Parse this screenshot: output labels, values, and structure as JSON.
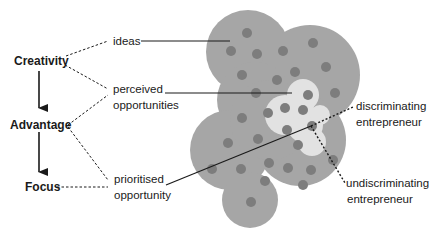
{
  "diagram": {
    "stages": [
      {
        "label": "Creativity"
      },
      {
        "label": "Advantage"
      },
      {
        "label": "Focus"
      }
    ],
    "concepts": [
      {
        "label": "ideas"
      },
      {
        "label_line1": "perceived",
        "label_line2": "opportunities"
      },
      {
        "label_line1": "prioritised",
        "label_line2": "opportunity"
      }
    ],
    "entrepreneurs": [
      {
        "label_line1": "discriminating",
        "label_line2": "entrepreneur"
      },
      {
        "label_line1": "undiscriminating",
        "label_line2": "entrepreneur"
      }
    ],
    "colors": {
      "outer_blob": "#a6a6a6",
      "inner_blob": "#e2e2e2",
      "dots": "#7d7d7d",
      "lines": "#1a1a1a"
    }
  }
}
